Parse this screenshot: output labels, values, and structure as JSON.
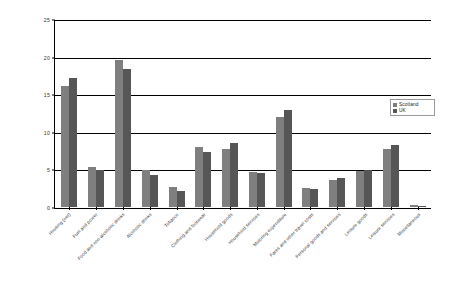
{
  "chart_data": {
    "type": "bar",
    "title": "",
    "subtitle": "",
    "xlabel": "",
    "ylabel": "",
    "ylim": [
      0,
      25
    ],
    "yticks": [
      0,
      5,
      10,
      15,
      20,
      25
    ],
    "grid": true,
    "legend_position": "right",
    "categories": [
      "Housing (net)",
      "Fuel and power",
      "Food and non-alcoholic drinks",
      "Alcoholic drinks",
      "Tobacco",
      "Clothing and footwear",
      "Household goods",
      "Household services",
      "Motoring expenditure",
      "Fares and other travel costs",
      "Personal goods and services",
      "Leisure goods",
      "Leisure services",
      "Miscellaneous"
    ],
    "series": [
      {
        "name": "Scotland",
        "color": "#7f7f7f",
        "values": [
          16.2,
          5.3,
          19.7,
          5.0,
          2.7,
          8.0,
          7.7,
          4.7,
          12.0,
          2.6,
          3.6,
          4.8,
          7.7,
          0.3
        ]
      },
      {
        "name": "UK",
        "color": "#565656",
        "values": [
          17.2,
          4.9,
          18.5,
          4.3,
          2.2,
          7.3,
          8.6,
          4.6,
          13.0,
          2.4,
          3.9,
          4.9,
          8.3,
          0.2
        ]
      }
    ]
  },
  "legend": {
    "items": [
      {
        "label": "Scotland"
      },
      {
        "label": "UK"
      }
    ]
  }
}
